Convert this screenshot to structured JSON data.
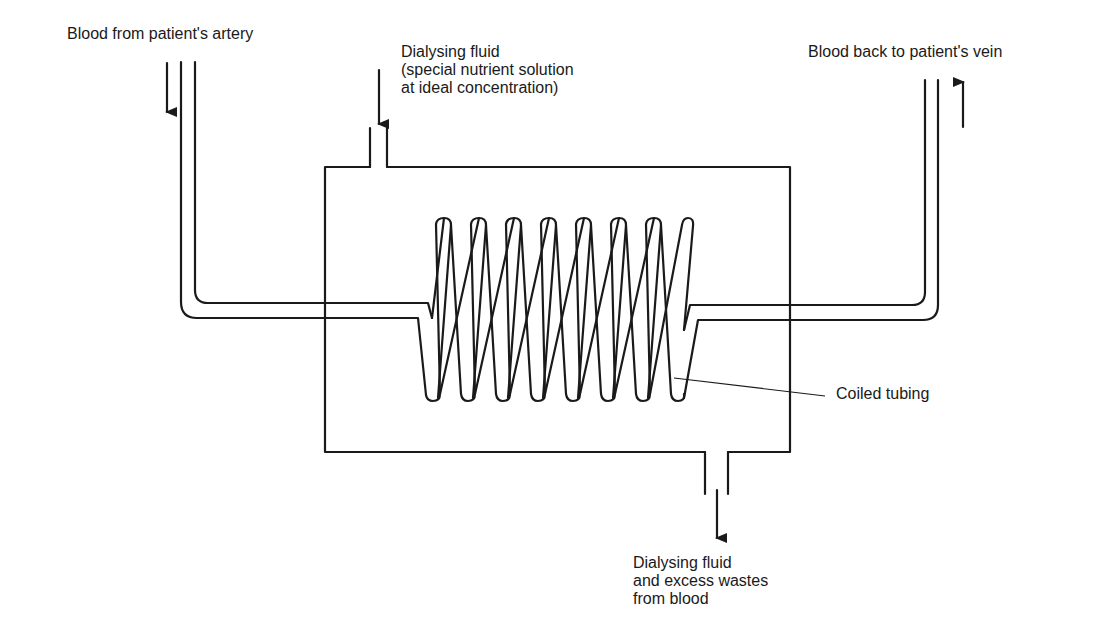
{
  "diagram": {
    "labels": {
      "blood_in": "Blood from patient's artery",
      "dialysing_in": {
        "line1": "Dialysing fluid",
        "line2": "(special nutrient solution",
        "line3": "at ideal concentration)"
      },
      "blood_out": "Blood back to patient's vein",
      "coil": "Coiled tubing",
      "dialysing_out": {
        "line1": "Dialysing fluid",
        "line2": "and excess wastes",
        "line3": "from blood"
      }
    },
    "components": [
      {
        "id": "dialysis-chamber",
        "shape": "rectangle"
      },
      {
        "id": "fluid-inlet",
        "position": "top"
      },
      {
        "id": "fluid-outlet",
        "position": "bottom"
      },
      {
        "id": "arterial-tube",
        "flow": "down"
      },
      {
        "id": "venous-tube",
        "flow": "up"
      },
      {
        "id": "coiled-tubing",
        "loops": 10
      }
    ],
    "colors": {
      "line": "#1a1a1a",
      "background": "#ffffff"
    }
  }
}
